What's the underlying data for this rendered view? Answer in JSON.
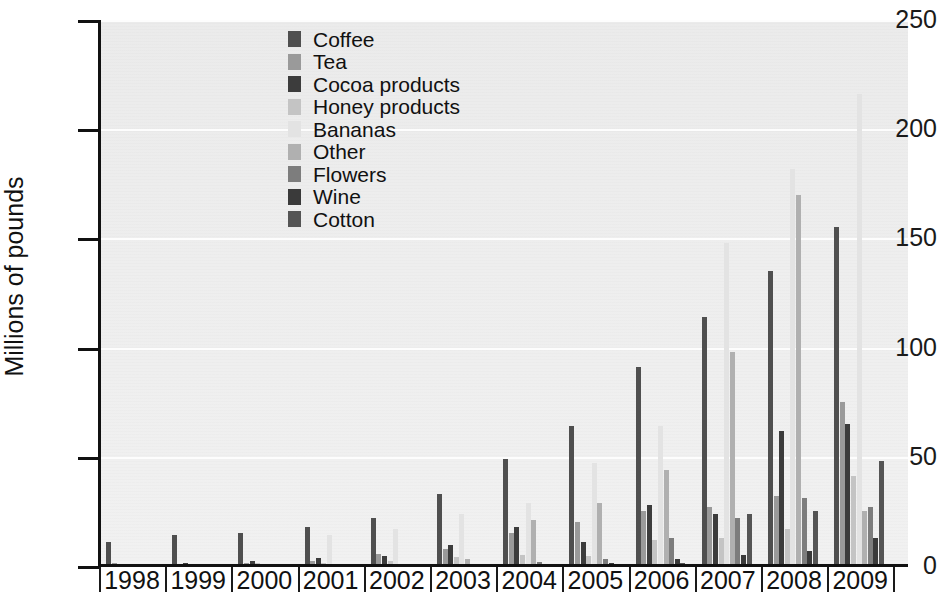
{
  "chart_data": {
    "type": "bar",
    "title": "",
    "xlabel": "Year",
    "ylabel": "Millions of pounds",
    "ylim": [
      0,
      250
    ],
    "yticks": [
      0,
      50,
      100,
      150,
      200,
      250
    ],
    "grid": true,
    "legend_position": "top-left-inside",
    "categories": [
      "1998",
      "1999",
      "2000",
      "2001",
      "2002",
      "2003",
      "2004",
      "2005",
      "2006",
      "2007",
      "2008",
      "2009"
    ],
    "series": [
      {
        "name": "Coffee",
        "color": "#4f4f4f",
        "values": [
          11,
          14,
          15,
          18,
          22,
          33,
          49,
          64,
          91,
          114,
          135,
          155
        ]
      },
      {
        "name": "Tea",
        "color": "#9a9a9a",
        "values": [
          1.5,
          1.0,
          1.5,
          2.5,
          5.5,
          8.0,
          15,
          20,
          25,
          27,
          32,
          75
        ]
      },
      {
        "name": "Cocoa products",
        "color": "#3c3c3c",
        "values": [
          0.8,
          1.5,
          2.5,
          3.5,
          4.5,
          9.5,
          18,
          11,
          28,
          24,
          62,
          65
        ]
      },
      {
        "name": "Honey products",
        "color": "#c4c4c4",
        "values": [
          0.3,
          0.5,
          1.2,
          1.5,
          2.5,
          4.0,
          5.0,
          4.5,
          12,
          13,
          17,
          41
        ]
      },
      {
        "name": "Bananas",
        "color": "#e3e3e3",
        "values": [
          0.2,
          0.3,
          0.6,
          14,
          17,
          24,
          29,
          47,
          64,
          148,
          182,
          216
        ]
      },
      {
        "name": "Other",
        "color": "#b0b0b0",
        "values": [
          0.2,
          0.2,
          0.4,
          0.8,
          1.0,
          3.0,
          21,
          29,
          44,
          98,
          170,
          25
        ]
      },
      {
        "name": "Flowers",
        "color": "#7d7d7d",
        "values": [
          0,
          0,
          0.2,
          0.3,
          0.5,
          1.0,
          2.0,
          3.0,
          13,
          22,
          31,
          27
        ]
      },
      {
        "name": "Wine",
        "color": "#3a3a3a",
        "values": [
          0,
          0,
          0,
          0.2,
          0.4,
          0.6,
          1.0,
          1.5,
          3.0,
          5.0,
          7.0,
          13
        ]
      },
      {
        "name": "Cotton",
        "color": "#555555",
        "values": [
          0,
          0,
          0,
          0,
          0.2,
          0.3,
          0.5,
          0.8,
          1.5,
          24,
          25,
          48
        ]
      }
    ]
  },
  "axis": {
    "ylabel": "Millions of pounds",
    "ytick_labels": [
      "250",
      "200",
      "150",
      "100",
      "50",
      "0"
    ]
  },
  "legend": {
    "items": [
      {
        "label": "Coffee",
        "color": "#4f4f4f"
      },
      {
        "label": "Tea",
        "color": "#9a9a9a"
      },
      {
        "label": "Cocoa products",
        "color": "#3c3c3c"
      },
      {
        "label": "Honey products",
        "color": "#c4c4c4"
      },
      {
        "label": "Bananas",
        "color": "#e3e3e3"
      },
      {
        "label": "Other",
        "color": "#b0b0b0"
      },
      {
        "label": "Flowers",
        "color": "#7d7d7d"
      },
      {
        "label": "Wine",
        "color": "#3a3a3a"
      },
      {
        "label": "Cotton",
        "color": "#555555"
      }
    ]
  },
  "title_fragment": ""
}
